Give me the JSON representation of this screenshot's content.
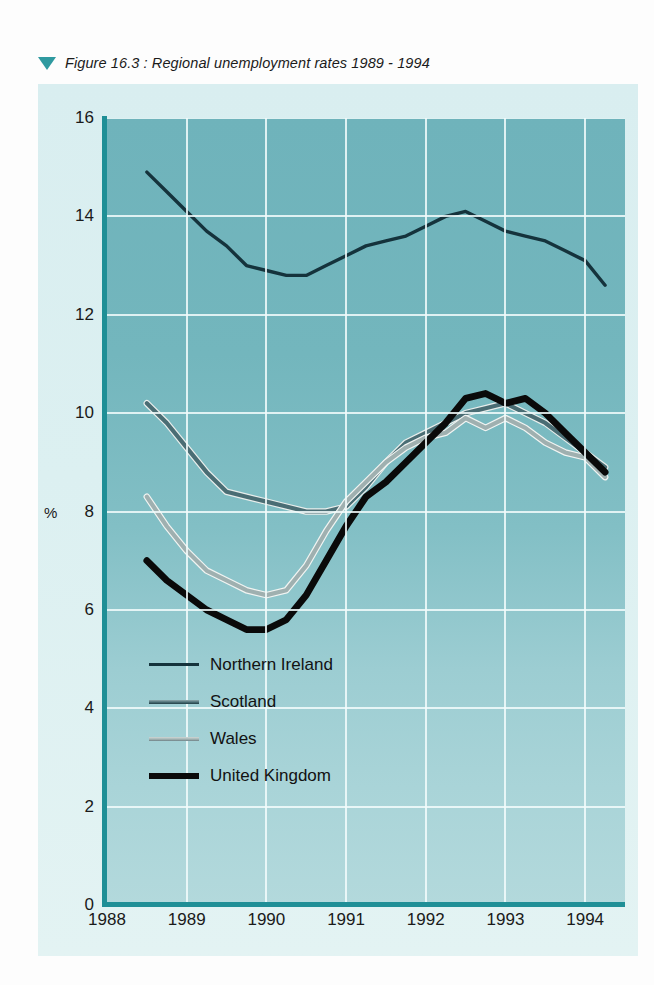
{
  "caption": {
    "marker_icon": "triangle-down-icon",
    "text": "Figure 16.3 : Regional unemployment rates 1989 - 1994"
  },
  "axis": {
    "y_label": "%",
    "y_ticks": [
      "0",
      "2",
      "4",
      "6",
      "8",
      "10",
      "12",
      "14",
      "16"
    ],
    "x_ticks": [
      "1988",
      "1989",
      "1990",
      "1991",
      "1992",
      "1993",
      "1994"
    ]
  },
  "legend": {
    "items": [
      {
        "label": "Northern Ireland",
        "color": "#15333c",
        "sample_icon": "line-sample-icon"
      },
      {
        "label": "Scotland",
        "color": "#4a6d74",
        "sample_icon": "line-sample-icon"
      },
      {
        "label": "Wales",
        "color": "#9fb0b0",
        "sample_icon": "line-sample-icon"
      },
      {
        "label": "United Kingdom",
        "color": "#0a0a0a",
        "sample_icon": "line-sample-icon"
      }
    ]
  },
  "colors": {
    "plot_background_top": "#6fb3bb",
    "plot_background_bottom": "#b3d9dc",
    "figure_background": "#dcf0f1",
    "axis": "#1f8f96",
    "gridline": "#f2fbfb",
    "caption_marker": "#2f9aa0"
  },
  "chart_data": {
    "type": "line",
    "title": "Figure 16.3 : Regional unemployment rates 1989 - 1994",
    "xlabel": "",
    "ylabel": "%",
    "xlim": [
      1988.0,
      1994.5
    ],
    "ylim": [
      0,
      16
    ],
    "yticks": [
      0,
      2,
      4,
      6,
      8,
      10,
      12,
      14,
      16
    ],
    "xticks": [
      1988,
      1989,
      1990,
      1991,
      1992,
      1993,
      1994
    ],
    "grid": true,
    "legend_position": "inside-lower-left",
    "x": [
      1988.5,
      1988.75,
      1989.0,
      1989.25,
      1989.5,
      1989.75,
      1990.0,
      1990.25,
      1990.5,
      1990.75,
      1991.0,
      1991.25,
      1991.5,
      1991.75,
      1992.0,
      1992.25,
      1992.5,
      1992.75,
      1993.0,
      1993.25,
      1993.5,
      1993.75,
      1994.0,
      1994.25
    ],
    "series": [
      {
        "name": "Northern Ireland",
        "color": "#15333c",
        "values": [
          14.9,
          14.5,
          14.1,
          13.7,
          13.4,
          13.0,
          12.9,
          12.8,
          12.8,
          13.0,
          13.2,
          13.4,
          13.5,
          13.6,
          13.8,
          14.0,
          14.1,
          13.9,
          13.7,
          13.6,
          13.5,
          13.3,
          13.1,
          12.6
        ]
      },
      {
        "name": "Scotland",
        "color": "#4a6d74",
        "values": [
          10.2,
          9.8,
          9.3,
          8.8,
          8.4,
          8.3,
          8.2,
          8.1,
          8.0,
          8.0,
          8.1,
          8.5,
          9.0,
          9.4,
          9.6,
          9.8,
          10.0,
          10.1,
          10.2,
          10.0,
          9.8,
          9.5,
          9.2,
          8.9
        ]
      },
      {
        "name": "Wales",
        "color": "#9fb0b0",
        "values": [
          8.3,
          7.7,
          7.2,
          6.8,
          6.6,
          6.4,
          6.3,
          6.4,
          6.9,
          7.6,
          8.2,
          8.6,
          9.0,
          9.3,
          9.5,
          9.6,
          9.9,
          9.7,
          9.9,
          9.7,
          9.4,
          9.2,
          9.1,
          8.7
        ]
      },
      {
        "name": "United Kingdom",
        "color": "#0a0a0a",
        "values": [
          7.0,
          6.6,
          6.3,
          6.0,
          5.8,
          5.6,
          5.6,
          5.8,
          6.3,
          7.0,
          7.7,
          8.3,
          8.6,
          9.0,
          9.4,
          9.8,
          10.3,
          10.4,
          10.2,
          10.3,
          10.0,
          9.6,
          9.2,
          8.8
        ]
      }
    ]
  }
}
